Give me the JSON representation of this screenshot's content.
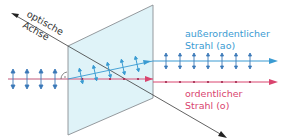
{
  "diagram": {
    "optic_axis_label_line1": "optische",
    "optic_axis_label_line2": "Achse",
    "extraordinary_label_line1": "außerordentlicher",
    "extraordinary_label_line2": "Strahl (ao)",
    "ordinary_label_line1": "ordentlicher",
    "ordinary_label_line2": "Strahl (o)",
    "colors": {
      "extraordinary": "#3a9bd2",
      "ordinary": "#d9446e",
      "plate_fill": "#dff3f8",
      "plate_edge": "#8a8f93",
      "axis": "#3a3a3a",
      "incoming_polarization": "#3a78b8"
    },
    "icons": [
      "right-angle-marker",
      "polarization-arrow",
      "polarization-dot",
      "arrow-head"
    ]
  }
}
